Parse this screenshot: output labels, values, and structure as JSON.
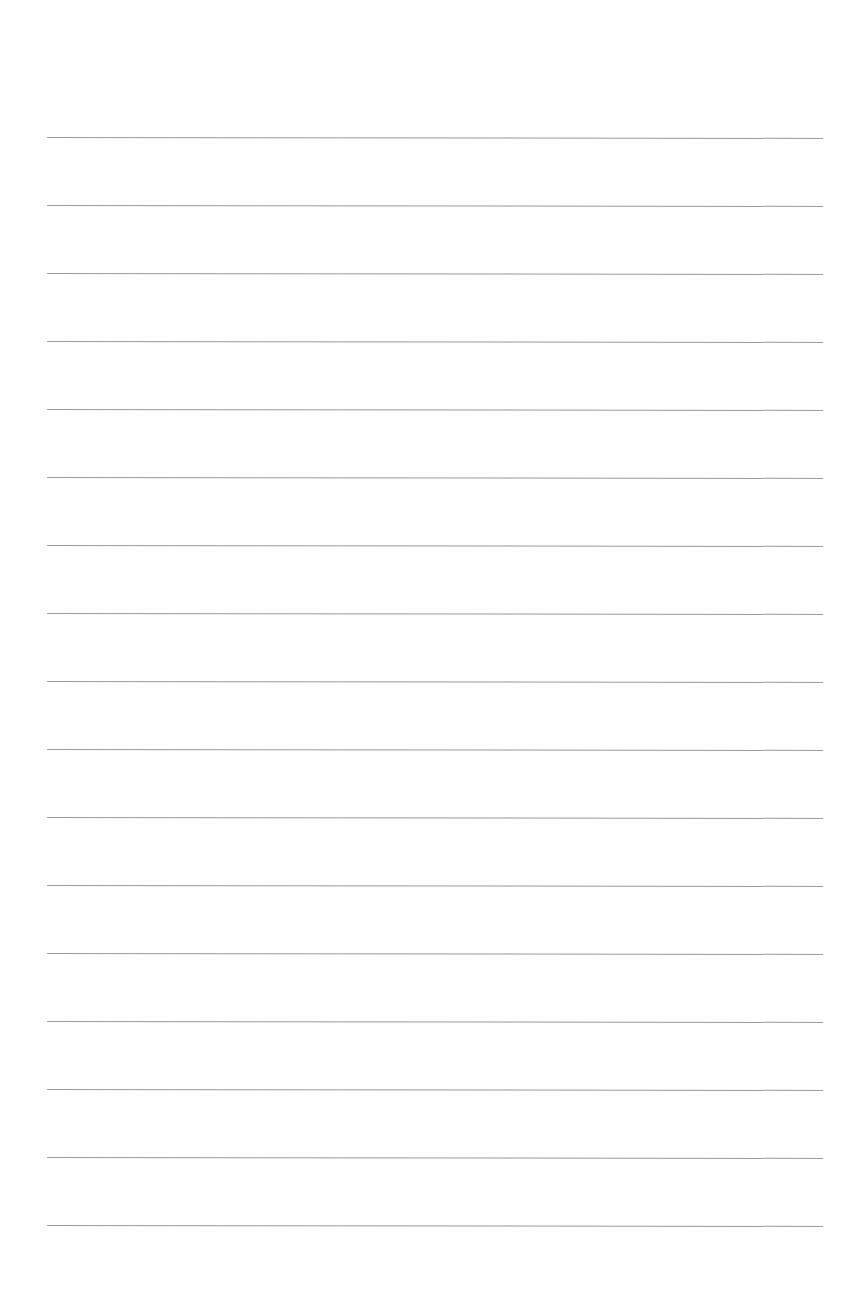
{
  "page": {
    "type": "lined-paper",
    "background_color": "#fefefe",
    "line_color": "#8a8a8a",
    "line_count": 17,
    "first_line_y": 137,
    "line_spacing": 68,
    "line_left": 47,
    "line_right": 823
  },
  "lines": [
    {
      "index": 1,
      "text": ""
    },
    {
      "index": 2,
      "text": ""
    },
    {
      "index": 3,
      "text": ""
    },
    {
      "index": 4,
      "text": ""
    },
    {
      "index": 5,
      "text": ""
    },
    {
      "index": 6,
      "text": ""
    },
    {
      "index": 7,
      "text": ""
    },
    {
      "index": 8,
      "text": ""
    },
    {
      "index": 9,
      "text": ""
    },
    {
      "index": 10,
      "text": ""
    },
    {
      "index": 11,
      "text": ""
    },
    {
      "index": 12,
      "text": ""
    },
    {
      "index": 13,
      "text": ""
    },
    {
      "index": 14,
      "text": ""
    },
    {
      "index": 15,
      "text": ""
    },
    {
      "index": 16,
      "text": ""
    },
    {
      "index": 17,
      "text": ""
    }
  ]
}
